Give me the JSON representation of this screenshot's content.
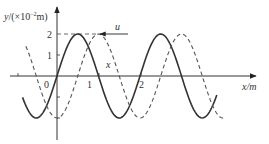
{
  "diagram": {
    "type": "transverse-wave-graph",
    "y_axis_label_var": "y",
    "y_axis_label_unit_prefix": "/(×10",
    "y_axis_label_exp": "−2",
    "y_axis_label_unit_suffix": "m)",
    "x_axis_label": "x/m",
    "y_ticks": [
      {
        "value": 1,
        "label": "1"
      },
      {
        "value": 2,
        "label": "2"
      }
    ],
    "x_ticks": [
      {
        "value": -1,
        "label": ""
      },
      {
        "value": 0,
        "label": "0"
      },
      {
        "value": 1,
        "label": "1"
      },
      {
        "value": 2,
        "label": "2"
      }
    ],
    "velocity_label": "u",
    "velocity_direction": "left",
    "dashed_wave_label": "x",
    "amplitude": 2,
    "wavelength": 2,
    "waves": [
      {
        "name": "solid-wave",
        "style": "solid",
        "phase_shift_m": 0,
        "x_range": [
          -0.83,
          3.85
        ],
        "color": "#333333"
      },
      {
        "name": "dashed-wave",
        "style": "dashed",
        "phase_shift_m": 0.5,
        "x_range": [
          -0.75,
          4.05
        ],
        "color": "#555555"
      }
    ],
    "guide_lines": [
      {
        "label": "peak-level-2",
        "y": 2
      }
    ]
  },
  "colors": {
    "axis": "#333333",
    "solid": "#333333",
    "dashed": "#555555",
    "background": "#ffffff"
  }
}
